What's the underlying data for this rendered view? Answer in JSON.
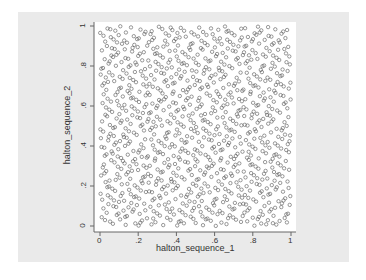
{
  "chart_data": {
    "type": "scatter",
    "title": "",
    "xlabel": "halton_sequence_1",
    "ylabel": "halton_sequence_2",
    "xlim": [
      0,
      1
    ],
    "ylim": [
      0,
      1
    ],
    "x_ticks": [
      "0",
      ".2",
      ".4",
      ".6",
      ".8",
      "1"
    ],
    "y_ticks": [
      "0",
      ".2",
      ".4",
      ".6",
      ".8",
      "1"
    ],
    "grid": false,
    "legend": null,
    "marker": "hollow-circle",
    "marker_color": "#555555",
    "series": [
      {
        "name": "halton points",
        "generator": "halton",
        "x_base": 2,
        "y_base": 3,
        "n_points": 1000
      }
    ]
  },
  "colors": {
    "graph_background": "#eaeaea",
    "plot_background": "#ffffff",
    "axis": "#666666",
    "marker": "#555555"
  }
}
